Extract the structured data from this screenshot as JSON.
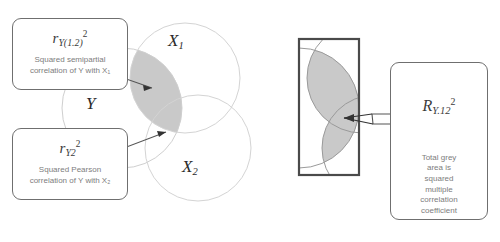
{
  "figure": {
    "background_color": "#ffffff",
    "shade_color": "#c9c9c9",
    "circle_stroke_color": "#d0d0d0",
    "box_stroke_color": "#6f6f6f",
    "rect_stroke_color": "#4a4a4a",
    "text_color": "#7d7d7d"
  },
  "left_panel": {
    "venn_labels": {
      "y": "Y",
      "x1_base": "X",
      "x1_sub": "1",
      "x2_base": "X",
      "x2_sub": "2"
    },
    "callout_semipartial": {
      "formula_base": "r",
      "formula_sub": "Y(1.2)",
      "formula_sup": "2",
      "description": "Squared semipartial\ncorrelation of Y with X₁"
    },
    "callout_pearson": {
      "formula_base": "r",
      "formula_sub": "Y2",
      "formula_sup": "2",
      "description": "Squared Pearson\ncorrelation of Y with X₂"
    }
  },
  "right_panel": {
    "callout_multiple": {
      "formula_base": "R",
      "formula_sub": "Y.12",
      "formula_sup": "2",
      "description": "Total grey\narea is\nsquared\nmultiple\ncorrelation\ncoefficient"
    }
  }
}
